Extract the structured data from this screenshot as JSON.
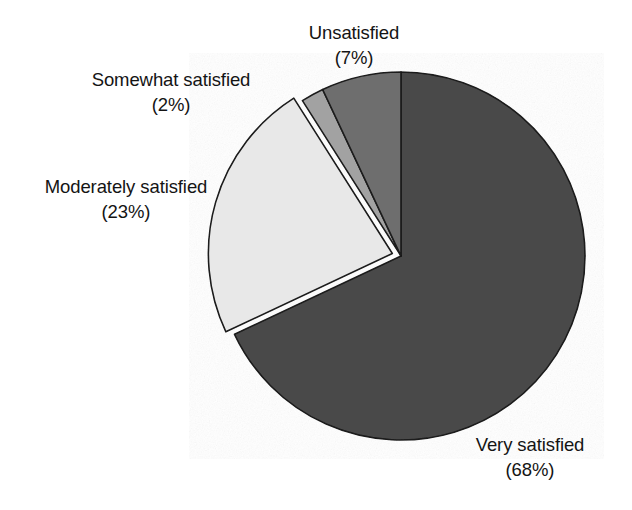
{
  "chart_data": {
    "type": "pie",
    "title": "",
    "subtitle": "",
    "xlabel": "",
    "ylabel": "",
    "legend_position": "none",
    "grid": false,
    "units": "percent",
    "start_angle_deg": 0,
    "direction": "clockwise",
    "categories": [
      "Very satisfied",
      "Moderately satisfied",
      "Somewhat satisfied",
      "Unsatisfied"
    ],
    "values": [
      68,
      23,
      2,
      7
    ],
    "slices": [
      {
        "label": "Very satisfied",
        "value": 68,
        "value_text": "(68%)",
        "color": "#4a4a4a",
        "exploded": false,
        "start_deg": 0,
        "end_deg": 244.8
      },
      {
        "label": "Moderately satisfied",
        "value": 23,
        "value_text": "(23%)",
        "color": "#e8e8e8",
        "exploded": true,
        "start_deg": 244.8,
        "end_deg": 327.6
      },
      {
        "label": "Somewhat satisfied",
        "value": 2,
        "value_text": "(2%)",
        "color": "#a2a2a2",
        "exploded": false,
        "start_deg": 327.6,
        "end_deg": 334.8
      },
      {
        "label": "Unsatisfied",
        "value": 7,
        "value_text": "(7%)",
        "color": "#6e6e6e",
        "exploded": false,
        "start_deg": 334.8,
        "end_deg": 360
      }
    ]
  },
  "labels": {
    "unsatisfied": {
      "name": "Unsatisfied",
      "value": "(7%)"
    },
    "somewhat": {
      "name": "Somewhat satisfied",
      "value": "(2%)"
    },
    "moderately": {
      "name": "Moderately satisfied",
      "value": "(23%)"
    },
    "very": {
      "name": "Very satisfied",
      "value": "(68%)"
    }
  },
  "colors": {
    "very_satisfied": "#4a4a4a",
    "moderately_satisfied": "#e8e8e8",
    "somewhat_satisfied": "#a2a2a2",
    "unsatisfied": "#6e6e6e",
    "outline": "#1a1a1a",
    "background": "#ffffff",
    "text": "#141414"
  }
}
